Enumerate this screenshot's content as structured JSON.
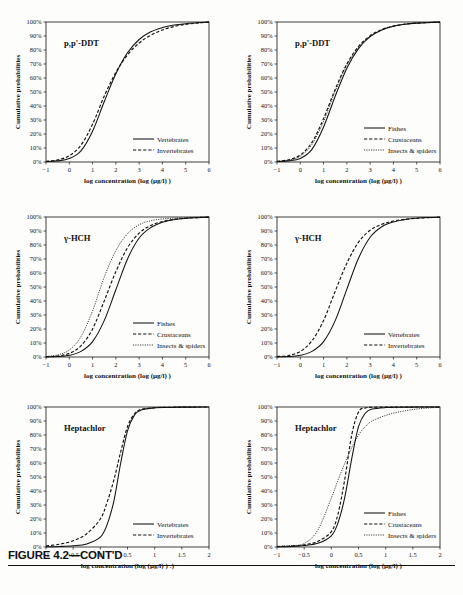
{
  "figure": {
    "caption": "FIGURE 4.2—CONT'D",
    "axis": {
      "xlabel": "log concentration (log (µg/l) )",
      "xlabel_bottom_left": "log concentration (log (µg/l) ) :)",
      "ylabel": "Cumulative probabilities",
      "yticks": [
        "0%",
        "10%",
        "20%",
        "30%",
        "40%",
        "50%",
        "60%",
        "70%",
        "80%",
        "90%",
        "100%"
      ],
      "xticks_wide": [
        "-1",
        "0",
        "1",
        "2",
        "3",
        "4",
        "5",
        "6"
      ],
      "xticks_narrow": [
        "-1",
        "-0.5",
        "0",
        "0.5",
        "1",
        "1.5",
        "2"
      ]
    },
    "legend_labels": {
      "vertebrates": "Vertebrates",
      "invertebrates": "Invertebrates",
      "fishes": "Fishes",
      "crustaceans": "Crustaceans",
      "insects_spiders": "Insects & spiders"
    }
  },
  "chart_data": [
    {
      "id": "ddt-vert-invert",
      "type": "line",
      "title": "p,p'-DDT",
      "xlabel": "log concentration (log (µg/l) )",
      "ylabel": "Cumulative probabilities",
      "xlim": [
        -1,
        6
      ],
      "ylim": [
        0,
        100
      ],
      "xticks": [
        -1,
        0,
        1,
        2,
        3,
        4,
        5,
        6
      ],
      "yticks": [
        0,
        10,
        20,
        30,
        40,
        50,
        60,
        70,
        80,
        90,
        100
      ],
      "grid": false,
      "legend_position": "lower-right",
      "x": [
        -1,
        -0.5,
        0,
        0.5,
        1,
        1.5,
        2,
        2.5,
        3,
        3.5,
        4,
        4.5,
        5,
        5.5,
        6
      ],
      "series": [
        {
          "name": "Vertebrates",
          "style": "solid",
          "values": [
            0.3,
            0.8,
            2.5,
            8.0,
            22.0,
            43.0,
            63.0,
            78.0,
            87.5,
            93.0,
            96.0,
            97.8,
            98.8,
            99.4,
            99.9
          ]
        },
        {
          "name": "Invertebrates",
          "style": "dashed",
          "values": [
            0.5,
            1.5,
            4.5,
            12.0,
            27.0,
            47.0,
            64.0,
            76.5,
            85.0,
            90.5,
            94.3,
            96.8,
            98.3,
            99.2,
            99.9
          ]
        }
      ]
    },
    {
      "id": "ddt-three-groups",
      "type": "line",
      "title": "p,p'-DDT",
      "xlabel": "log concentration (log (µg/l) )",
      "ylabel": "Cumulative probabilities",
      "xlim": [
        -1,
        6
      ],
      "ylim": [
        0,
        100
      ],
      "xticks": [
        -1,
        0,
        1,
        2,
        3,
        4,
        5,
        6
      ],
      "yticks": [
        0,
        10,
        20,
        30,
        40,
        50,
        60,
        70,
        80,
        90,
        100
      ],
      "grid": false,
      "legend_position": "lower-right",
      "x": [
        -1,
        -0.5,
        0,
        0.5,
        1,
        1.5,
        2,
        2.5,
        3,
        3.5,
        4,
        4.5,
        5,
        5.5,
        6
      ],
      "series": [
        {
          "name": "Fishes",
          "style": "solid",
          "values": [
            0.3,
            0.8,
            2.5,
            9.0,
            25.0,
            47.0,
            67.0,
            81.0,
            89.5,
            94.3,
            97.0,
            98.4,
            99.2,
            99.6,
            99.9
          ]
        },
        {
          "name": "Crustaceans",
          "style": "dashed",
          "values": [
            0.5,
            1.6,
            5.0,
            14.0,
            31.0,
            52.0,
            70.0,
            82.5,
            90.2,
            94.6,
            97.1,
            98.5,
            99.2,
            99.6,
            99.9
          ]
        },
        {
          "name": "Insects & spiders",
          "style": "dotted",
          "values": [
            0.4,
            1.3,
            4.2,
            12.5,
            29.0,
            50.5,
            69.0,
            81.8,
            89.8,
            94.4,
            97.0,
            98.4,
            99.2,
            99.6,
            99.9
          ]
        }
      ]
    },
    {
      "id": "hch-three-groups",
      "type": "line",
      "title": "γ-HCH",
      "xlabel": "log concentration (log (µg/l) )",
      "ylabel": "Cumulative probabilities",
      "xlim": [
        -1,
        6
      ],
      "ylim": [
        0,
        100
      ],
      "xticks": [
        -1,
        0,
        1,
        2,
        3,
        4,
        5,
        6
      ],
      "yticks": [
        0,
        10,
        20,
        30,
        40,
        50,
        60,
        70,
        80,
        90,
        100
      ],
      "grid": false,
      "legend_position": "lower-right",
      "x": [
        -1,
        -0.5,
        0,
        0.5,
        1,
        1.5,
        2,
        2.5,
        3,
        3.5,
        4,
        4.5,
        5,
        5.5,
        6
      ],
      "series": [
        {
          "name": "Fishes",
          "style": "solid",
          "values": [
            0.1,
            0.3,
            1.2,
            4.0,
            11.0,
            26.0,
            48.0,
            70.0,
            85.0,
            92.5,
            96.3,
            98.1,
            99.0,
            99.5,
            99.9
          ]
        },
        {
          "name": "Crustaceans",
          "style": "dashed",
          "values": [
            0.2,
            0.7,
            2.6,
            8.0,
            20.0,
            40.0,
            61.0,
            78.0,
            88.5,
            94.0,
            96.8,
            98.3,
            99.1,
            99.6,
            99.9
          ]
        },
        {
          "name": "Insects & spiders",
          "style": "dotted",
          "values": [
            0.4,
            1.5,
            5.0,
            14.5,
            33.0,
            57.0,
            76.0,
            88.0,
            94.5,
            97.3,
            98.6,
            99.2,
            99.5,
            99.8,
            99.9
          ]
        }
      ]
    },
    {
      "id": "hch-vert-invert",
      "type": "line",
      "title": "γ-HCH",
      "xlabel": "log concentration (log (µg/l) )",
      "ylabel": "Cumulative probabilities",
      "xlim": [
        -1,
        6
      ],
      "ylim": [
        0,
        100
      ],
      "xticks": [
        -1,
        0,
        1,
        2,
        3,
        4,
        5,
        6
      ],
      "yticks": [
        0,
        10,
        20,
        30,
        40,
        50,
        60,
        70,
        80,
        90,
        100
      ],
      "grid": false,
      "legend_position": "lower-right",
      "x": [
        -1,
        -0.5,
        0,
        0.5,
        1,
        1.5,
        2,
        2.5,
        3,
        3.5,
        4,
        4.5,
        5,
        5.5,
        6
      ],
      "series": [
        {
          "name": "Vertebrates",
          "style": "solid",
          "values": [
            0.1,
            0.3,
            1.2,
            4.0,
            11.0,
            26.0,
            48.5,
            70.5,
            85.5,
            93.0,
            96.5,
            98.2,
            99.1,
            99.6,
            99.9
          ]
        },
        {
          "name": "Invertebrates",
          "style": "dashed",
          "values": [
            0.3,
            1.1,
            4.0,
            11.5,
            26.0,
            47.0,
            67.0,
            82.0,
            90.5,
            94.8,
            97.1,
            98.4,
            99.1,
            99.5,
            99.8
          ]
        }
      ]
    },
    {
      "id": "heptachlor-vert-invert",
      "type": "line",
      "title": "Heptachlor",
      "xlabel": "log concentration (log (µg/l) ) :)",
      "ylabel": "Cumulative probabilities",
      "xlim": [
        -1,
        2
      ],
      "ylim": [
        0,
        100
      ],
      "xticks": [
        -1,
        -0.5,
        0,
        0.5,
        1,
        1.5,
        2
      ],
      "yticks": [
        0,
        10,
        20,
        30,
        40,
        50,
        60,
        70,
        80,
        90,
        100
      ],
      "grid": false,
      "legend_position": "lower-right",
      "x": [
        -1,
        -0.75,
        -0.5,
        -0.25,
        0,
        0.125,
        0.25,
        0.375,
        0.5,
        0.625,
        0.75,
        1.0,
        1.25,
        1.5,
        1.75,
        2.0
      ],
      "series": [
        {
          "name": "Vertebrates",
          "style": "solid",
          "values": [
            0.2,
            0.4,
            0.9,
            2.2,
            7.0,
            16.0,
            33.0,
            60.0,
            83.0,
            94.0,
            97.8,
            99.4,
            99.7,
            99.9,
            99.9,
            100
          ]
        },
        {
          "name": "Invertebrates",
          "style": "dashed",
          "values": [
            0.8,
            2.0,
            4.5,
            9.5,
            20.0,
            32.0,
            48.0,
            68.0,
            86.0,
            95.0,
            98.3,
            99.5,
            99.8,
            99.9,
            100,
            100
          ]
        }
      ]
    },
    {
      "id": "heptachlor-three-groups",
      "type": "line",
      "title": "Heptachlor",
      "xlabel": "log concentration (log (µg/l) )",
      "ylabel": "Cumulative probabilities",
      "xlim": [
        -1,
        2
      ],
      "ylim": [
        0,
        100
      ],
      "xticks": [
        -1,
        -0.5,
        0,
        0.5,
        1,
        1.5,
        2
      ],
      "yticks": [
        0,
        10,
        20,
        30,
        40,
        50,
        60,
        70,
        80,
        90,
        100
      ],
      "grid": false,
      "legend_position": "lower-right",
      "x": [
        -1,
        -0.75,
        -0.5,
        -0.25,
        0,
        0.125,
        0.25,
        0.375,
        0.5,
        0.625,
        0.75,
        1.0,
        1.25,
        1.5,
        1.75,
        2.0
      ],
      "series": [
        {
          "name": "Fishes",
          "style": "solid",
          "values": [
            0.2,
            0.4,
            1.0,
            2.6,
            8.0,
            17.5,
            36.0,
            63.0,
            86.0,
            95.5,
            98.5,
            99.6,
            99.8,
            99.9,
            100,
            100
          ]
        },
        {
          "name": "Crustaceans",
          "style": "dashed",
          "values": [
            0.3,
            0.7,
            1.6,
            4.0,
            11.0,
            24.0,
            49.0,
            80.0,
            96.5,
            99.3,
            99.8,
            99.9,
            100,
            100,
            100,
            100
          ]
        },
        {
          "name": "Insects & spiders",
          "style": "dotted",
          "values": [
            0.5,
            1.0,
            2.5,
            12.0,
            35.0,
            48.0,
            60.0,
            71.0,
            80.0,
            86.0,
            90.0,
            94.0,
            96.5,
            98.2,
            99.2,
            99.8
          ]
        }
      ]
    }
  ]
}
